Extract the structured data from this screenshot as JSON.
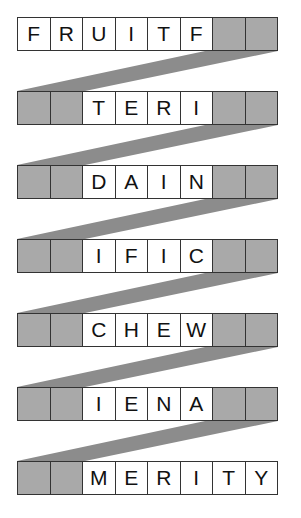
{
  "puzzle": {
    "title": "",
    "colors": {
      "shaded_cell": "#a9a9a9",
      "band": "#8c8c8c",
      "border": "#333333"
    },
    "rows": [
      {
        "cells": [
          "F",
          "R",
          "U",
          "I",
          "T",
          "F",
          "",
          ""
        ],
        "shaded": [
          false,
          false,
          false,
          false,
          false,
          false,
          true,
          true
        ]
      },
      {
        "cells": [
          "",
          "",
          "T",
          "E",
          "R",
          "I",
          "",
          ""
        ],
        "shaded": [
          true,
          true,
          false,
          false,
          false,
          false,
          true,
          true
        ]
      },
      {
        "cells": [
          "",
          "",
          "D",
          "A",
          "I",
          "N",
          "",
          ""
        ],
        "shaded": [
          true,
          true,
          false,
          false,
          false,
          false,
          true,
          true
        ]
      },
      {
        "cells": [
          "",
          "",
          "I",
          "F",
          "I",
          "C",
          "",
          ""
        ],
        "shaded": [
          true,
          true,
          false,
          false,
          false,
          false,
          true,
          true
        ]
      },
      {
        "cells": [
          "",
          "",
          "C",
          "H",
          "E",
          "W",
          "",
          ""
        ],
        "shaded": [
          true,
          true,
          false,
          false,
          false,
          false,
          true,
          true
        ]
      },
      {
        "cells": [
          "",
          "",
          "I",
          "E",
          "N",
          "A",
          "",
          ""
        ],
        "shaded": [
          true,
          true,
          false,
          false,
          false,
          false,
          true,
          true
        ]
      },
      {
        "cells": [
          "",
          "",
          "M",
          "E",
          "R",
          "I",
          "T",
          "Y"
        ],
        "shaded": [
          true,
          true,
          false,
          false,
          false,
          false,
          false,
          false
        ]
      }
    ]
  }
}
